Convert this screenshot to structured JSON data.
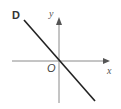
{
  "diagram": {
    "panel_label": "D",
    "x_axis_label": "x",
    "y_axis_label": "y",
    "origin_label": "O",
    "line": {
      "description": "straight line through origin with negative slope",
      "slope_sign": "negative",
      "passes_through_origin": true
    },
    "colors": {
      "line": "#222222",
      "axes": "#888888",
      "background": "#ffffff"
    }
  }
}
